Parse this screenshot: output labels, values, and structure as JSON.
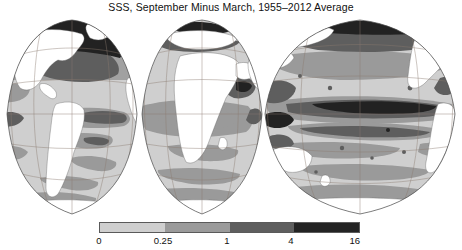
{
  "figure": {
    "title": "SSS, September Minus March, 1955–2012 Average",
    "background_color": "#ffffff",
    "text_color": "#111111"
  },
  "chart_data": {
    "type": "heatmap",
    "title": "SSS, September Minus March, 1955–2012 Average",
    "subtitle": "",
    "xlabel": "",
    "ylabel": "",
    "projection": "interrupted-goode-homolosine",
    "variable": "Sea Surface Salinity difference (September minus March)",
    "averaging_period": "1955–2012",
    "grid": true,
    "graticule_interval_degrees": 30,
    "legend_position": "bottom",
    "colorbar": {
      "orientation": "horizontal",
      "scale": "nonlinear-quantile",
      "tick_values": [
        0,
        0.25,
        1,
        4,
        16
      ],
      "tick_labels": [
        "0",
        "0.25",
        "1",
        "4",
        "16"
      ],
      "bins": [
        {
          "range": [
            0,
            0.25
          ],
          "color": "#cfcfcf",
          "label": "0–0.25"
        },
        {
          "range": [
            0.25,
            1
          ],
          "color": "#9a9a9a",
          "label": "0.25–1"
        },
        {
          "range": [
            1,
            4
          ],
          "color": "#5e5e5e",
          "label": "1–4"
        },
        {
          "range": [
            4,
            16
          ],
          "color": "#232323",
          "label": "4–16"
        }
      ],
      "land_color": "#ffffff",
      "outline_color": "#4a4a4a"
    },
    "lobes": [
      {
        "name": "Americas / Atlantic",
        "center_longitude": -70
      },
      {
        "name": "Europe / Africa / Indian Ocean",
        "center_longitude": 20
      },
      {
        "name": "Pacific Ocean",
        "center_longitude": 170
      }
    ]
  },
  "colorbar_labels": [
    {
      "text": "0",
      "x_pct": 0
    },
    {
      "text": "0.25",
      "x_pct": 24.5
    },
    {
      "text": "1",
      "x_pct": 49
    },
    {
      "text": "4",
      "x_pct": 73.5
    },
    {
      "text": "16",
      "x_pct": 98
    }
  ]
}
